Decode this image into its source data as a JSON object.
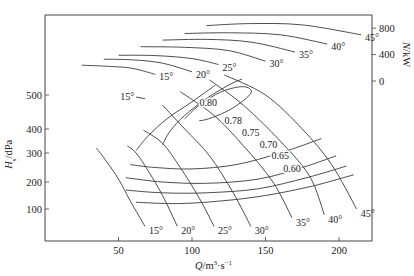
{
  "chart_data": {
    "type": "line",
    "title": "",
    "xlabel": "Q/m³·s⁻¹",
    "ylabel": "H_s/dPa",
    "y2label": "N/kW",
    "xlim": [
      0,
      222
    ],
    "ylim": [
      0,
      620
    ],
    "y2lim": [
      0,
      900
    ],
    "grid": false,
    "x_ticks": [
      50,
      100,
      150,
      200
    ],
    "y_ticks": [
      100,
      200,
      300,
      400,
      500
    ],
    "y2_ticks": [
      0,
      400,
      800
    ],
    "pressure_curves": [
      {
        "name": "15°",
        "points": [
          [
            35,
            320
          ],
          [
            42,
            270
          ],
          [
            50,
            210
          ],
          [
            58,
            130
          ],
          [
            68,
            40
          ]
        ],
        "label": "15°"
      },
      {
        "name": "20°",
        "points": [
          [
            56,
            330
          ],
          [
            62,
            300
          ],
          [
            70,
            240
          ],
          [
            80,
            150
          ],
          [
            90,
            40
          ]
        ],
        "label": "20°"
      },
      {
        "name": "25°",
        "points": [
          [
            67,
            395
          ],
          [
            80,
            340
          ],
          [
            92,
            250
          ],
          [
            105,
            140
          ],
          [
            115,
            40
          ]
        ],
        "label": "25°"
      },
      {
        "name": "30°",
        "points": [
          [
            80,
            470
          ],
          [
            95,
            400
          ],
          [
            112,
            290
          ],
          [
            128,
            160
          ],
          [
            140,
            40
          ]
        ],
        "label": "30°"
      },
      {
        "name": "35°",
        "points": [
          [
            92,
            510
          ],
          [
            115,
            440
          ],
          [
            135,
            330
          ],
          [
            155,
            200
          ],
          [
            168,
            70
          ]
        ],
        "label": "35°"
      },
      {
        "name": "40°",
        "points": [
          [
            112,
            545
          ],
          [
            135,
            470
          ],
          [
            160,
            350
          ],
          [
            180,
            220
          ],
          [
            190,
            80
          ]
        ],
        "label": "40°"
      },
      {
        "name": "45°",
        "points": [
          [
            122,
            560
          ],
          [
            150,
            500
          ],
          [
            175,
            400
          ],
          [
            195,
            260
          ],
          [
            212,
            100
          ]
        ],
        "label": "45°"
      }
    ],
    "efficiency_curves": [
      {
        "name": "0.80",
        "points": [
          [
            95,
            430
          ],
          [
            105,
            470
          ],
          [
            120,
            510
          ],
          [
            135,
            525
          ],
          [
            140,
            505
          ],
          [
            125,
            455
          ],
          [
            105,
            425
          ],
          [
            95,
            430
          ]
        ],
        "closed": true,
        "label": "0.80"
      },
      {
        "name": "0.78",
        "points": [
          [
            80,
            335
          ],
          [
            85,
            390
          ],
          [
            95,
            440
          ],
          [
            110,
            490
          ],
          [
            125,
            530
          ],
          [
            134,
            548
          ]
        ],
        "closed": false,
        "label": "0.78"
      },
      {
        "name": "0.75",
        "points": [
          [
            62,
            310
          ],
          [
            70,
            370
          ],
          [
            83,
            430
          ],
          [
            100,
            480
          ],
          [
            116,
            530
          ]
        ],
        "closed": false,
        "label": "0.75"
      },
      {
        "name": "0.70",
        "points": [
          [
            58,
            260
          ],
          [
            75,
            250
          ],
          [
            100,
            245
          ],
          [
            130,
            260
          ],
          [
            160,
            300
          ],
          [
            188,
            360
          ]
        ],
        "closed": false,
        "label": "0.70"
      },
      {
        "name": "0.65",
        "points": [
          [
            55,
            215
          ],
          [
            80,
            200
          ],
          [
            110,
            195
          ],
          [
            145,
            210
          ],
          [
            175,
            250
          ],
          [
            198,
            290
          ]
        ],
        "closed": false,
        "label": "0.65"
      },
      {
        "name": "0.60",
        "points": [
          [
            55,
            170
          ],
          [
            80,
            160
          ],
          [
            110,
            160
          ],
          [
            145,
            175
          ],
          [
            178,
            215
          ],
          [
            205,
            255
          ]
        ],
        "closed": false,
        "label": "0.60"
      },
      {
        "name": "lower",
        "points": [
          [
            62,
            125
          ],
          [
            90,
            120
          ],
          [
            120,
            130
          ],
          [
            150,
            150
          ],
          [
            182,
            185
          ],
          [
            210,
            225
          ]
        ],
        "closed": false,
        "label": ""
      }
    ],
    "power_curves": [
      {
        "name": "15°",
        "points": [
          [
            25,
            240
          ],
          [
            45,
            220
          ],
          [
            60,
            190
          ],
          [
            75,
            100
          ]
        ],
        "label": "15°"
      },
      {
        "name": "20°",
        "points": [
          [
            40,
            330
          ],
          [
            60,
            320
          ],
          [
            80,
            270
          ],
          [
            100,
            140
          ]
        ],
        "label": "20°"
      },
      {
        "name": "25°",
        "points": [
          [
            50,
            390
          ],
          [
            75,
            385
          ],
          [
            100,
            340
          ],
          [
            118,
            250
          ]
        ],
        "label": "25°"
      },
      {
        "name": "30°",
        "points": [
          [
            65,
            520
          ],
          [
            95,
            510
          ],
          [
            125,
            460
          ],
          [
            150,
            300
          ]
        ],
        "label": "30°"
      },
      {
        "name": "35°",
        "points": [
          [
            80,
            620
          ],
          [
            110,
            630
          ],
          [
            140,
            590
          ],
          [
            170,
            440
          ]
        ],
        "label": "35°"
      },
      {
        "name": "40°",
        "points": [
          [
            95,
            720
          ],
          [
            125,
            730
          ],
          [
            160,
            700
          ],
          [
            192,
            560
          ]
        ],
        "label": "40°"
      },
      {
        "name": "45°",
        "points": [
          [
            110,
            840
          ],
          [
            140,
            870
          ],
          [
            175,
            850
          ],
          [
            215,
            700
          ]
        ],
        "label": "45°"
      }
    ],
    "annotations": {
      "top_15_label": "15°"
    }
  }
}
